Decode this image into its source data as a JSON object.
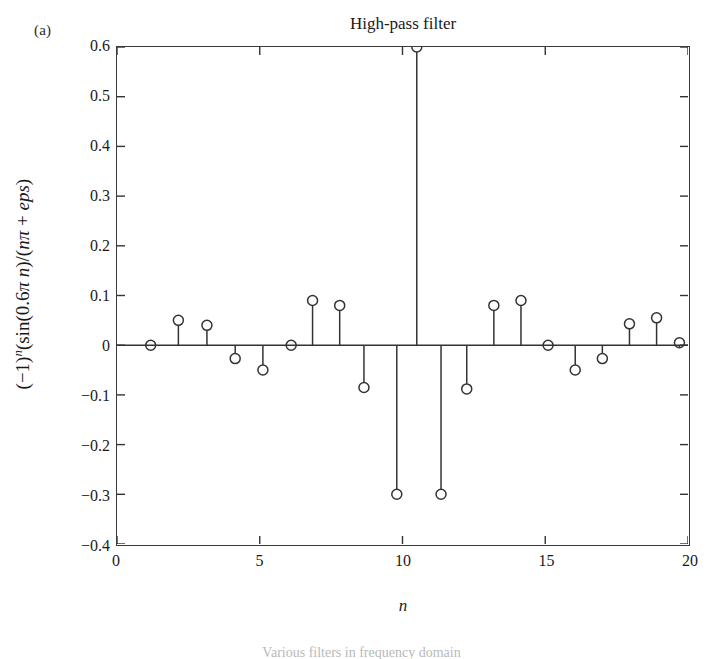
{
  "panel": {
    "label": "(a)"
  },
  "chart_data": {
    "type": "scatter",
    "subtype": "stem",
    "title": "High-pass filter",
    "xlabel": "n",
    "ylabel": "(−1)ⁿ(sin(0.6π n)/(nπ + eps)",
    "ylabel_parts": {
      "base": "(−1)",
      "exponent": "n",
      "rest": "(sin(0.6π n)/(nπ + eps)"
    },
    "xlim": [
      0,
      20
    ],
    "ylim": [
      -0.4,
      0.6
    ],
    "xticks": [
      0,
      5,
      10,
      15,
      20
    ],
    "xtick_labels": [
      "0",
      "5",
      "10",
      "15",
      "20"
    ],
    "yticks": [
      0.6,
      0.5,
      0.4,
      0.3,
      0.2,
      0.1,
      0,
      -0.1,
      -0.2,
      -0.3,
      -0.4
    ],
    "ytick_labels": [
      "0.6",
      "0.5",
      "0.4",
      "0.3",
      "0.2",
      "0.1",
      "0",
      "−0.1",
      "−0.2",
      "−0.3",
      "−0.4"
    ],
    "grid": false,
    "legend": false,
    "marker": "open-circle",
    "marker_radius": 5,
    "line_color": "#333333",
    "baseline": 0,
    "x": [
      1.18,
      2.15,
      3.15,
      4.14,
      5.11,
      6.1,
      6.85,
      7.8,
      8.65,
      9.8,
      10.5,
      11.35,
      12.25,
      13.2,
      14.15,
      15.1,
      16.05,
      17.0,
      17.95,
      18.9,
      19.7
    ],
    "values": [
      0.0,
      0.05,
      0.04,
      -0.027,
      -0.05,
      0.0,
      0.09,
      0.08,
      -0.085,
      -0.3,
      0.6,
      -0.3,
      -0.088,
      0.08,
      0.09,
      0.0,
      -0.05,
      -0.027,
      0.043,
      0.055,
      0.005
    ]
  },
  "caption": {
    "text": "Various filters in frequency domain"
  }
}
